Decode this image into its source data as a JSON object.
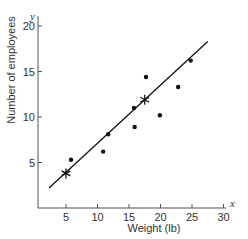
{
  "chart_data": {
    "type": "scatter",
    "title": "",
    "xlabel": "Weight (lb)",
    "ylabel": "Number of employees",
    "x_axis_var": "x",
    "y_axis_var": "y",
    "xlim": [
      0,
      30
    ],
    "ylim": [
      0,
      20
    ],
    "x_ticks": [
      5,
      10,
      15,
      20,
      25,
      30
    ],
    "y_ticks": [
      5,
      10,
      15,
      20
    ],
    "grid": false,
    "legend": null,
    "series": [
      {
        "name": "observations",
        "marker": "dot",
        "points": [
          {
            "x": 5.8,
            "y": 5.3
          },
          {
            "x": 10.9,
            "y": 6.2
          },
          {
            "x": 11.7,
            "y": 8.1
          },
          {
            "x": 15.8,
            "y": 11.0
          },
          {
            "x": 15.9,
            "y": 8.9
          },
          {
            "x": 17.7,
            "y": 14.4
          },
          {
            "x": 19.9,
            "y": 10.2
          },
          {
            "x": 22.8,
            "y": 13.3
          },
          {
            "x": 24.8,
            "y": 16.2
          }
        ]
      },
      {
        "name": "fitted points",
        "marker": "star",
        "points": [
          {
            "x": 5.0,
            "y": 3.8
          },
          {
            "x": 17.5,
            "y": 11.9
          }
        ]
      },
      {
        "name": "regression line",
        "type": "line",
        "points": [
          {
            "x": 2.3,
            "y": 2.2
          },
          {
            "x": 27.5,
            "y": 18.3
          }
        ]
      }
    ]
  },
  "labels": {
    "xlabel": "Weight (lb)",
    "ylabel": "Number of employees",
    "x_var": "x",
    "y_var": "y"
  }
}
